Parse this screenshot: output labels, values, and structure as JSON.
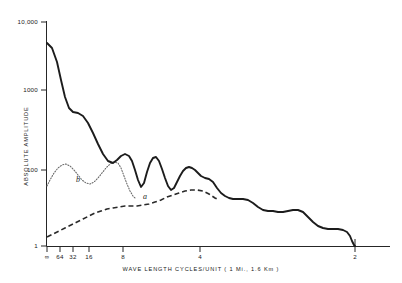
{
  "chart_data": {
    "type": "line",
    "title": "",
    "xlabel": "WAVE  LENGTH   CYCLES/UNIT  ( 1 Mi., 1.6 Km )",
    "ylabel": "ABSOLUTE  AMPLITUDE",
    "yscale": "log",
    "ylim": [
      1,
      10000
    ],
    "y_tick_labels": [
      "10,000",
      "1000",
      "100",
      "1"
    ],
    "y_tick_values": [
      10000,
      1000,
      100,
      1
    ],
    "x_tick_labels": [
      "∞",
      "64",
      "32",
      "16",
      "8",
      "4",
      "2"
    ],
    "x_tick_values": [
      0,
      64,
      32,
      16,
      8,
      4,
      2
    ],
    "grid": false,
    "legend": "inline-annotations",
    "annotations": [
      {
        "text": "a",
        "x_px": 145,
        "y_px": 199
      },
      {
        "text": "b",
        "x_px": 78,
        "y_px": 182
      }
    ],
    "series": [
      {
        "name": "total-spectrum",
        "style": "solid",
        "color": "#1c1c1c",
        "points_px": "47,43 52,48 57,62 61,80 65,97 69,108 73,112 78,113 83,116 88,123 93,133 98,144 103,154 108,161 113,163 117,160 121,156 125,154 129,156 132,161 135,170 138,180 141,187 144,183 147,172 150,163 153,158 156,157 159,161 162,169 165,178 168,186 171,190 174,188 177,182 180,176 183,171 186,168 189,167 192,168 195,170 198,173 201,176 205,178 209,179 213,182 217,188 221,193 225,196 229,198 233,199 238,199 243,199 248,200 253,203 258,207 263,210 268,211 273,211 278,212 283,212 288,211 293,210 298,210 303,212 308,217 313,222 318,226 323,228 328,229 333,229 338,229 343,230 347,232 350,236 352,241 354,245 355,246"
      },
      {
        "name": "curve-b-component",
        "style": "dotted",
        "color": "#6a6a6a",
        "points_px": "47,186 50,180 54,173 58,168 62,165 66,164 70,166 74,170 78,175 82,180 86,183 90,184 94,182 98,178 102,173 106,168 110,164 114,162 118,163 121,168 124,176 127,184 130,191 133,196 136,199"
      },
      {
        "name": "curve-a-component",
        "style": "dashed",
        "color": "#2a2a2a",
        "points_px": "47,237 53,234 59,231 65,228 71,225 77,222 83,219 89,216 95,213 101,211 107,209 113,208 119,207 125,206 131,206 137,206 143,205 149,204 155,202 161,200 167,197 173,195 179,193 185,191 191,190 197,190 203,191 209,194 215,198 219,200"
      }
    ]
  },
  "axes": {
    "y_axis_label": "ABSOLUTE  AMPLITUDE",
    "x_axis_label": "WAVE  LENGTH   CYCLES/UNIT  ( 1 Mi., 1.6 Km )",
    "y_ticks": [
      {
        "label": "10,000",
        "y_px": 22
      },
      {
        "label": "1000",
        "y_px": 90
      },
      {
        "label": "100",
        "y_px": 170
      },
      {
        "label": "1",
        "y_px": 246
      }
    ],
    "x_ticks": [
      {
        "label": "∞",
        "x_px": 47
      },
      {
        "label": "64",
        "x_px": 60
      },
      {
        "label": "32",
        "x_px": 73
      },
      {
        "label": "16",
        "x_px": 89
      },
      {
        "label": "8",
        "x_px": 123
      },
      {
        "label": "4",
        "x_px": 200
      },
      {
        "label": "2",
        "x_px": 355
      }
    ]
  },
  "curve_labels": {
    "a": "a",
    "b": "b"
  }
}
